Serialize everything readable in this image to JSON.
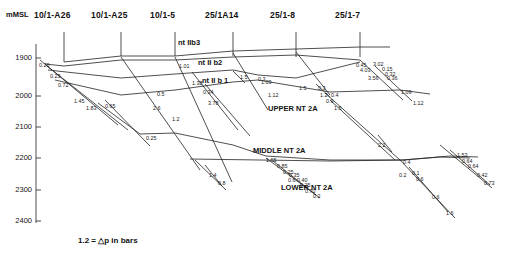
{
  "figure": {
    "caption": "1.2 = △p in bars",
    "axis_unit_label": "mMSL"
  },
  "wells": [
    {
      "name": "10/1-A26",
      "x": 57,
      "y": 14,
      "top_x": 64,
      "top_y": 32,
      "bot_y": 62
    },
    {
      "name": "10/1-A25",
      "x": 114,
      "y": 14,
      "top_x": 121,
      "top_y": 32,
      "bot_y": 56
    },
    {
      "name": "10/1-5",
      "x": 168,
      "y": 14,
      "top_x": 175,
      "top_y": 32,
      "bot_y": 56
    },
    {
      "name": "25/1A14",
      "x": 228,
      "y": 14,
      "top_x": 233,
      "top_y": 32,
      "bot_y": 56
    },
    {
      "name": "25/1-8",
      "x": 290,
      "y": 14,
      "top_x": 296,
      "top_y": 32,
      "bot_y": 56
    },
    {
      "name": "25/1-7",
      "x": 355,
      "y": 14,
      "top_x": 360,
      "top_y": 32,
      "bot_y": 57
    }
  ],
  "y_axis": {
    "ticks": [
      "1900",
      "2000",
      "2100",
      "2200",
      "2300",
      "2400"
    ],
    "tick_y": [
      58,
      96,
      127,
      158,
      190,
      221
    ]
  },
  "formations": [
    {
      "label": "nt IIb3",
      "x": 178,
      "y": 38
    },
    {
      "label": "nt II b2",
      "x": 198,
      "y": 58
    },
    {
      "label": "nt II b 1",
      "x": 202,
      "y": 76
    },
    {
      "label": "UPPER NT 2A",
      "x": 268,
      "y": 104
    },
    {
      "label": "MIDDLE NT 2A",
      "x": 253,
      "y": 146
    },
    {
      "label": "LOWER NT 2A",
      "x": 281,
      "y": 183
    }
  ],
  "values": [
    {
      "v": "0.26",
      "x": 39,
      "y": 62,
      "r": 0
    },
    {
      "v": "0.23",
      "x": 50,
      "y": 73,
      "r": 0
    },
    {
      "v": "0.72",
      "x": 58,
      "y": 82,
      "r": 0
    },
    {
      "v": "1.45",
      "x": 74,
      "y": 98,
      "r": 0
    },
    {
      "v": "1.83",
      "x": 86,
      "y": 105,
      "r": 0
    },
    {
      "v": "0.65",
      "x": 105,
      "y": 103,
      "r": 0
    },
    {
      "v": "0.5",
      "x": 157,
      "y": 91,
      "r": 0
    },
    {
      "v": "2.6",
      "x": 153,
      "y": 105,
      "r": 0
    },
    {
      "v": "1.2",
      "x": 172,
      "y": 116,
      "r": 0
    },
    {
      "v": "0.25",
      "x": 146,
      "y": 135,
      "r": 0
    },
    {
      "v": "1.01",
      "x": 179,
      "y": 63,
      "r": 0
    },
    {
      "v": "1.38",
      "x": 192,
      "y": 80,
      "r": 0
    },
    {
      "v": "0.34",
      "x": 203,
      "y": 89,
      "r": 0
    },
    {
      "v": "3.78",
      "x": 208,
      "y": 100,
      "r": 0
    },
    {
      "v": "0.3",
      "x": 258,
      "y": 76,
      "r": 0
    },
    {
      "v": "1.5",
      "x": 240,
      "y": 74,
      "r": 0
    },
    {
      "v": "1.09",
      "x": 261,
      "y": 79,
      "r": 0
    },
    {
      "v": "1.12",
      "x": 268,
      "y": 92,
      "r": 0
    },
    {
      "v": "1.4",
      "x": 209,
      "y": 172,
      "r": 0
    },
    {
      "v": "0.8",
      "x": 218,
      "y": 180,
      "r": 0
    },
    {
      "v": "0.45",
      "x": 356,
      "y": 62,
      "r": 0
    },
    {
      "v": "3.02",
      "x": 373,
      "y": 61,
      "r": 0
    },
    {
      "v": "4.03",
      "x": 360,
      "y": 67,
      "r": 0
    },
    {
      "v": "0.15",
      "x": 382,
      "y": 66,
      "r": 0
    },
    {
      "v": "0.32",
      "x": 385,
      "y": 71,
      "r": 0
    },
    {
      "v": "3.56",
      "x": 368,
      "y": 75,
      "r": 0
    },
    {
      "v": "0.36",
      "x": 387,
      "y": 75,
      "r": 0
    },
    {
      "v": "1.09",
      "x": 401,
      "y": 89,
      "r": 0
    },
    {
      "v": "1.12",
      "x": 413,
      "y": 100,
      "r": 0
    },
    {
      "v": "1.5",
      "x": 299,
      "y": 85,
      "r": 0
    },
    {
      "v": "0.3",
      "x": 318,
      "y": 85,
      "r": 0
    },
    {
      "v": "1.2",
      "x": 320,
      "y": 92,
      "r": 0
    },
    {
      "v": "0.4",
      "x": 331,
      "y": 92,
      "r": 0
    },
    {
      "v": "0.9",
      "x": 326,
      "y": 98,
      "r": 0
    },
    {
      "v": "1.5",
      "x": 334,
      "y": 105,
      "r": 0
    },
    {
      "v": "2.2",
      "x": 378,
      "y": 142,
      "r": 0
    },
    {
      "v": "1.65",
      "x": 266,
      "y": 157,
      "r": 0
    },
    {
      "v": "0.85",
      "x": 277,
      "y": 163,
      "r": 0
    },
    {
      "v": "0.25",
      "x": 283,
      "y": 169,
      "r": 0
    },
    {
      "v": "0.35",
      "x": 289,
      "y": 172,
      "r": 0
    },
    {
      "v": "0.6",
      "x": 288,
      "y": 177,
      "r": 0
    },
    {
      "v": "0.40",
      "x": 297,
      "y": 177,
      "r": 0
    },
    {
      "v": "0.25",
      "x": 300,
      "y": 182,
      "r": 0
    },
    {
      "v": "0.70",
      "x": 305,
      "y": 188,
      "r": 0
    },
    {
      "v": "0.2",
      "x": 313,
      "y": 193,
      "r": 0
    },
    {
      "v": "0.4",
      "x": 403,
      "y": 159,
      "r": 0
    },
    {
      "v": "0.2",
      "x": 399,
      "y": 172,
      "r": 0
    },
    {
      "v": "0.1",
      "x": 412,
      "y": 170,
      "r": 0
    },
    {
      "v": "0.6",
      "x": 416,
      "y": 176,
      "r": 0
    },
    {
      "v": "0.6",
      "x": 432,
      "y": 194,
      "r": 0
    },
    {
      "v": "1.6",
      "x": 446,
      "y": 210,
      "r": 0
    },
    {
      "v": "1.53",
      "x": 457,
      "y": 152,
      "r": 0
    },
    {
      "v": "0.64",
      "x": 462,
      "y": 158,
      "r": 0
    },
    {
      "v": "0.64",
      "x": 468,
      "y": 163,
      "r": 0
    },
    {
      "v": "0.42",
      "x": 477,
      "y": 172,
      "r": 0
    },
    {
      "v": "0.73",
      "x": 484,
      "y": 180,
      "r": 0
    }
  ],
  "colors": {
    "line": "#222222",
    "text": "#111111",
    "background": "#ffffff"
  }
}
